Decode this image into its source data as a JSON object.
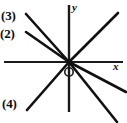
{
  "figure": {
    "background_color": "#ffffff",
    "ink_color": "#111111",
    "width": 127,
    "height": 123
  },
  "axes": {
    "x": {
      "label": "x",
      "label_style": "italic",
      "y_position": 62,
      "x_start": 4,
      "x_end": 123,
      "stroke_width": 2.0
    },
    "y": {
      "label": "y",
      "label_style": "italic",
      "x_position": 69,
      "y_start": 5,
      "y_end": 112,
      "stroke_width": 2.4
    },
    "origin": {
      "label": "O",
      "x": 69,
      "y": 62,
      "marker": "open-circle",
      "marker_x": 69,
      "marker_y": 72,
      "marker_radius": 4.2
    }
  },
  "lines": [
    {
      "id": "line-3",
      "label": "(3)",
      "description": "steep line from upper-left through origin",
      "x1": 26,
      "y1": 14,
      "x2": 69,
      "y2": 62,
      "stroke_width": 2.6,
      "label_x": 1,
      "label_y": 9
    },
    {
      "id": "line-2",
      "label": "(2)",
      "description": "shallow line from mid-left through origin",
      "x1": 26,
      "y1": 32,
      "x2": 69,
      "y2": 62,
      "stroke_width": 2.6,
      "label_x": 0,
      "label_y": 27
    },
    {
      "id": "line-4",
      "label": "(4)",
      "description": "line from origin down to lower-left",
      "x1": 69,
      "y1": 62,
      "x2": 27,
      "y2": 110,
      "stroke_width": 2.6,
      "label_x": 2,
      "label_y": 97
    },
    {
      "id": "line-upper-right",
      "label": "",
      "description": "unlabeled ray from origin to upper right, continuation of line (4)",
      "x1": 69,
      "y1": 62,
      "x2": 118,
      "y2": 13,
      "stroke_width": 2.6
    },
    {
      "id": "line-lower-right-shallow",
      "label": "",
      "description": "unlabeled ray from origin to lower right, continuation of line (2)",
      "x1": 69,
      "y1": 62,
      "x2": 126,
      "y2": 92,
      "stroke_width": 2.6
    },
    {
      "id": "line-lower-right-steep",
      "label": "",
      "description": "unlabeled ray from origin to lower right, continuation of line (3)",
      "x1": 69,
      "y1": 62,
      "x2": 117,
      "y2": 122,
      "stroke_width": 2.6
    }
  ]
}
